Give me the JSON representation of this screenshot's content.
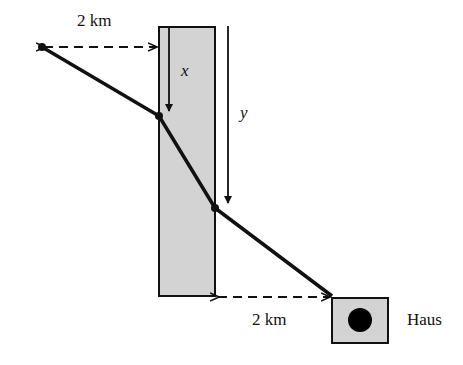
{
  "labels": {
    "top_distance": "2 km",
    "bottom_distance": "2 km",
    "x_var": "x",
    "y_var": "y",
    "house": "Haus"
  },
  "colors": {
    "river_fill": "#d3d3d3",
    "stroke": "#111111",
    "background": "#ffffff"
  }
}
